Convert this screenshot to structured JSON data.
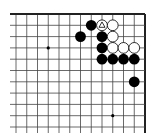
{
  "diagram": {
    "type": "go-board-corner",
    "corner": "top-right",
    "grid": {
      "cols": 13,
      "rows": 11,
      "x0": 16,
      "y0": 14,
      "dx": 10.75,
      "dy": 11.3,
      "edges": {
        "top": true,
        "right": true,
        "left": false,
        "bottom": false
      }
    },
    "colors": {
      "line": "#444444",
      "edge": "#222222",
      "black": "#000000",
      "white": "#ffffff",
      "background": "#ffffff"
    },
    "star_points": [
      [
        3,
        3
      ],
      [
        3,
        9
      ],
      [
        9,
        9
      ]
    ],
    "stones": [
      {
        "col": 7,
        "row": 1,
        "color": "black"
      },
      {
        "col": 8,
        "row": 1,
        "color": "white",
        "mark": "triangle"
      },
      {
        "col": 9,
        "row": 1,
        "color": "white"
      },
      {
        "col": 6,
        "row": 2,
        "color": "black"
      },
      {
        "col": 8,
        "row": 2,
        "color": "black"
      },
      {
        "col": 9,
        "row": 2,
        "color": "white"
      },
      {
        "col": 8,
        "row": 3,
        "color": "black"
      },
      {
        "col": 9,
        "row": 3,
        "color": "white"
      },
      {
        "col": 10,
        "row": 3,
        "color": "white"
      },
      {
        "col": 11,
        "row": 3,
        "color": "white"
      },
      {
        "col": 8,
        "row": 4,
        "color": "black"
      },
      {
        "col": 9,
        "row": 4,
        "color": "black"
      },
      {
        "col": 10,
        "row": 4,
        "color": "black"
      },
      {
        "col": 11,
        "row": 4,
        "color": "black"
      },
      {
        "col": 11,
        "row": 6,
        "color": "black"
      }
    ]
  }
}
